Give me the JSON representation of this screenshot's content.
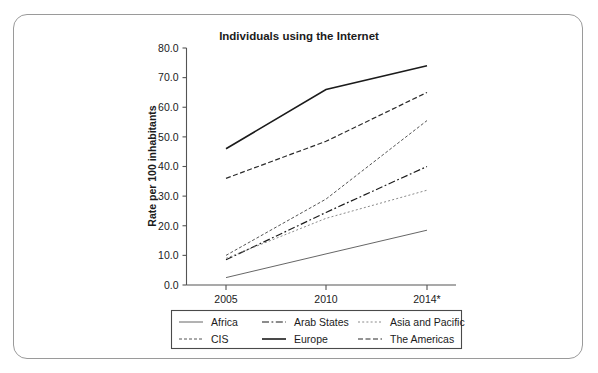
{
  "chart_data": {
    "type": "line",
    "title": "Individuals using the Internet",
    "xlabel": "",
    "ylabel": "Rate per 100 inhabitants",
    "categories": [
      "2005",
      "2010",
      "2014*"
    ],
    "x_tick_labels": [
      "2005",
      "2010",
      "2014*"
    ],
    "y_tick_labels": [
      "0.0",
      "10.0",
      "20.0",
      "30.0",
      "40.0",
      "50.0",
      "60.0",
      "70.0",
      "80.0"
    ],
    "y_ticks": [
      0,
      10,
      20,
      30,
      40,
      50,
      60,
      70,
      80
    ],
    "ylim": [
      0,
      80
    ],
    "grid": false,
    "legend_position": "bottom",
    "series": [
      {
        "name": "Africa",
        "values": [
          2.5,
          10.5,
          18.5
        ],
        "style": "solid",
        "width": 0.9,
        "color": "#555555"
      },
      {
        "name": "Arab States",
        "values": [
          8.5,
          24.5,
          40.0
        ],
        "style": "dash-dot",
        "width": 1.2,
        "color": "#1b1b1b"
      },
      {
        "name": "Asia and Pacific",
        "values": [
          9.0,
          22.5,
          32.0
        ],
        "style": "dotted",
        "width": 1.0,
        "color": "#8a8a8a"
      },
      {
        "name": "CIS",
        "values": [
          10.0,
          29.0,
          55.5
        ],
        "style": "fine-dash",
        "width": 1.0,
        "color": "#555555"
      },
      {
        "name": "Europe",
        "values": [
          46.0,
          66.0,
          74.0
        ],
        "style": "solid",
        "width": 1.6,
        "color": "#1b1b1b"
      },
      {
        "name": "The Americas",
        "values": [
          36.0,
          48.5,
          65.0
        ],
        "style": "dashed",
        "width": 1.2,
        "color": "#2b2b2b"
      }
    ],
    "legend_entries": [
      {
        "label": "Africa",
        "style": "solid",
        "column": 0,
        "row": 0
      },
      {
        "label": "Arab States",
        "style": "dash-dot",
        "column": 1,
        "row": 0
      },
      {
        "label": "Asia and Pacific",
        "style": "dotted",
        "column": 2,
        "row": 0
      },
      {
        "label": "CIS",
        "style": "fine-dash",
        "column": 0,
        "row": 1
      },
      {
        "label": "Europe",
        "style": "solid",
        "column": 1,
        "row": 1
      },
      {
        "label": "The Americas",
        "style": "dashed",
        "column": 2,
        "row": 1
      }
    ]
  },
  "colors": {
    "background": "#ffffff",
    "frame_border": "#9a9a9a",
    "axis": "#545454",
    "text": "#1b1b1b"
  }
}
